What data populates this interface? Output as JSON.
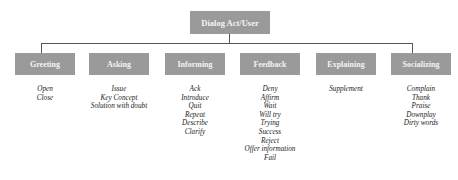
{
  "root": {
    "label": "Dialog Act/User"
  },
  "categories": [
    {
      "label": "Greeting",
      "items": [
        "Open",
        "Close"
      ]
    },
    {
      "label": "Asking",
      "items": [
        "Issue",
        "Key Concept",
        "Solution with doubt"
      ]
    },
    {
      "label": "Informing",
      "items": [
        "Ack",
        "Introduce",
        "Quit",
        "Repeat",
        "Describe",
        "Clarify"
      ]
    },
    {
      "label": "Feedback",
      "items": [
        "Deny",
        "Affirm",
        "Wait",
        "Will try",
        "Trying",
        "Success",
        "Reject",
        "Offer information",
        "Fail"
      ]
    },
    {
      "label": "Explaining",
      "items": [
        "Supplement"
      ]
    },
    {
      "label": "Socializing",
      "items": [
        "Complain",
        "Thank",
        "Praise",
        "Downplay",
        "Dirty words"
      ]
    }
  ],
  "colors": {
    "box_fill": "#9a9a9a",
    "box_text": "#f4f4f4",
    "connector": "#555555"
  }
}
